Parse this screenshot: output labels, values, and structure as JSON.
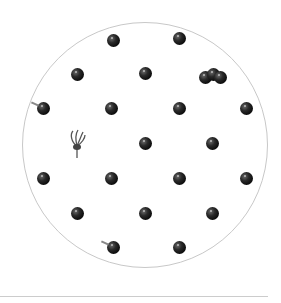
{
  "scene": {
    "description": "Black currant berries arranged on a white circular plate",
    "plate": {
      "cx": 145,
      "cy": 145,
      "r": 123,
      "border_color": "#c8c8c8"
    },
    "berries": [
      {
        "x": 113,
        "y": 40
      },
      {
        "x": 179,
        "y": 38
      },
      {
        "x": 77,
        "y": 74
      },
      {
        "x": 145,
        "y": 73
      },
      {
        "x": 205,
        "y": 77
      },
      {
        "x": 213,
        "y": 74
      },
      {
        "x": 220,
        "y": 77
      },
      {
        "x": 43,
        "y": 108,
        "stem": true
      },
      {
        "x": 111,
        "y": 108
      },
      {
        "x": 179,
        "y": 108
      },
      {
        "x": 246,
        "y": 108
      },
      {
        "x": 145,
        "y": 143
      },
      {
        "x": 212,
        "y": 143
      },
      {
        "x": 43,
        "y": 178
      },
      {
        "x": 111,
        "y": 178
      },
      {
        "x": 179,
        "y": 178
      },
      {
        "x": 246,
        "y": 178
      },
      {
        "x": 77,
        "y": 213
      },
      {
        "x": 145,
        "y": 213
      },
      {
        "x": 212,
        "y": 213
      },
      {
        "x": 113,
        "y": 247,
        "stem": true
      },
      {
        "x": 179,
        "y": 247
      }
    ],
    "flower": {
      "x": 77,
      "y": 143
    },
    "divider_color": "#cccccc"
  }
}
